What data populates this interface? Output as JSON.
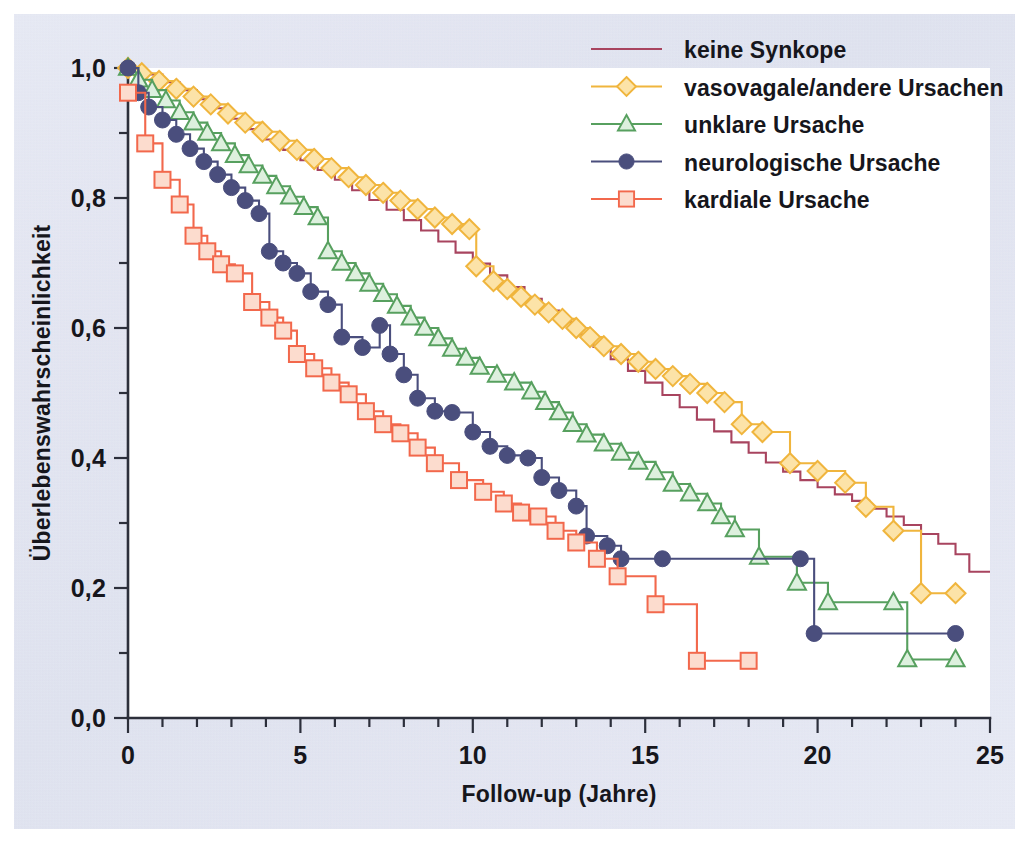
{
  "figure": {
    "background_color": "#d9dcec",
    "plot_background_color": "#ffffff",
    "border_color": "#ffffff"
  },
  "chart_data": {
    "type": "line",
    "subtype": "kaplan-meier-step",
    "title": "",
    "xlabel": "Follow-up (Jahre)",
    "ylabel": "Überlebenswahrscheinlichkeit",
    "xlim": [
      0,
      25
    ],
    "ylim": [
      0,
      1.0
    ],
    "xticks": [
      0,
      5,
      10,
      15,
      20,
      25
    ],
    "xtick_labels": [
      "0",
      "5",
      "10",
      "15",
      "20",
      "25"
    ],
    "xminor_tick_interval": 1,
    "yticks": [
      0.0,
      0.2,
      0.4,
      0.6,
      0.8,
      1.0
    ],
    "ytick_labels": [
      "0,0",
      "0,2",
      "0,4",
      "0,6",
      "0,8",
      "1,0"
    ],
    "yminor_tick_interval": 0.1,
    "grid": false,
    "legend_position": "top-right-inside",
    "decimal_separator": ",",
    "series": [
      {
        "name": "keine Synkope",
        "color": "#a8445f",
        "marker": "none",
        "points": [
          [
            0.0,
            1.0
          ],
          [
            0.5,
            0.99
          ],
          [
            1.0,
            0.978
          ],
          [
            1.5,
            0.966
          ],
          [
            2.0,
            0.952
          ],
          [
            2.5,
            0.938
          ],
          [
            3.0,
            0.922
          ],
          [
            3.5,
            0.906
          ],
          [
            4.0,
            0.89
          ],
          [
            4.5,
            0.874
          ],
          [
            5.0,
            0.858
          ],
          [
            5.5,
            0.843
          ],
          [
            6.0,
            0.828
          ],
          [
            6.5,
            0.812
          ],
          [
            7.0,
            0.797
          ],
          [
            7.5,
            0.782
          ],
          [
            8.0,
            0.766
          ],
          [
            8.5,
            0.75
          ],
          [
            9.0,
            0.733
          ],
          [
            9.5,
            0.716
          ],
          [
            10.0,
            0.699
          ],
          [
            10.5,
            0.681
          ],
          [
            11.0,
            0.663
          ],
          [
            11.5,
            0.645
          ],
          [
            12.0,
            0.627
          ],
          [
            12.5,
            0.609
          ],
          [
            13.0,
            0.59
          ],
          [
            13.5,
            0.571
          ],
          [
            14.0,
            0.552
          ],
          [
            14.5,
            0.534
          ],
          [
            15.0,
            0.516
          ],
          [
            15.5,
            0.497
          ],
          [
            16.0,
            0.478
          ],
          [
            16.5,
            0.459
          ],
          [
            17.0,
            0.441
          ],
          [
            17.5,
            0.424
          ],
          [
            18.0,
            0.408
          ],
          [
            18.5,
            0.393
          ],
          [
            19.0,
            0.379
          ],
          [
            19.5,
            0.366
          ],
          [
            20.0,
            0.355
          ],
          [
            20.5,
            0.344
          ],
          [
            21.0,
            0.334
          ],
          [
            21.5,
            0.322
          ],
          [
            22.0,
            0.31
          ],
          [
            22.5,
            0.297
          ],
          [
            23.0,
            0.283
          ],
          [
            23.5,
            0.268
          ],
          [
            24.0,
            0.252
          ],
          [
            24.4,
            0.225
          ],
          [
            25.0,
            0.225
          ]
        ]
      },
      {
        "name": "vasovagale/andere Ursachen",
        "color": "#f0b53d",
        "marker": "diamond",
        "points": [
          [
            0.0,
            1.0
          ],
          [
            0.4,
            0.992
          ],
          [
            0.9,
            0.98
          ],
          [
            1.4,
            0.968
          ],
          [
            1.9,
            0.956
          ],
          [
            2.4,
            0.944
          ],
          [
            2.9,
            0.93
          ],
          [
            3.4,
            0.916
          ],
          [
            3.9,
            0.902
          ],
          [
            4.4,
            0.888
          ],
          [
            4.9,
            0.874
          ],
          [
            5.4,
            0.86
          ],
          [
            5.9,
            0.846
          ],
          [
            6.4,
            0.832
          ],
          [
            6.9,
            0.82
          ],
          [
            7.4,
            0.808
          ],
          [
            7.9,
            0.796
          ],
          [
            8.4,
            0.783
          ],
          [
            8.9,
            0.77
          ],
          [
            9.4,
            0.76
          ],
          [
            9.9,
            0.752
          ],
          [
            10.1,
            0.695
          ],
          [
            10.6,
            0.672
          ],
          [
            11.0,
            0.66
          ],
          [
            11.4,
            0.648
          ],
          [
            11.8,
            0.636
          ],
          [
            12.2,
            0.624
          ],
          [
            12.6,
            0.614
          ],
          [
            13.0,
            0.6
          ],
          [
            13.4,
            0.586
          ],
          [
            13.8,
            0.572
          ],
          [
            14.3,
            0.56
          ],
          [
            14.8,
            0.548
          ],
          [
            15.3,
            0.537
          ],
          [
            15.8,
            0.526
          ],
          [
            16.3,
            0.514
          ],
          [
            16.8,
            0.5
          ],
          [
            17.3,
            0.486
          ],
          [
            17.8,
            0.452
          ],
          [
            18.4,
            0.44
          ],
          [
            19.2,
            0.392
          ],
          [
            20.0,
            0.38
          ],
          [
            20.8,
            0.362
          ],
          [
            21.4,
            0.325
          ],
          [
            22.2,
            0.288
          ],
          [
            23.0,
            0.192
          ],
          [
            24.0,
            0.192
          ]
        ]
      },
      {
        "name": "unklare Ursache",
        "color": "#57a05f",
        "marker": "triangle",
        "points": [
          [
            0.0,
            1.0
          ],
          [
            0.3,
            0.982
          ],
          [
            0.7,
            0.966
          ],
          [
            1.1,
            0.95
          ],
          [
            1.5,
            0.932
          ],
          [
            1.9,
            0.916
          ],
          [
            2.3,
            0.9
          ],
          [
            2.7,
            0.884
          ],
          [
            3.1,
            0.866
          ],
          [
            3.5,
            0.85
          ],
          [
            3.9,
            0.834
          ],
          [
            4.3,
            0.818
          ],
          [
            4.7,
            0.802
          ],
          [
            5.1,
            0.786
          ],
          [
            5.5,
            0.77
          ],
          [
            5.8,
            0.718
          ],
          [
            6.2,
            0.7
          ],
          [
            6.6,
            0.684
          ],
          [
            7.0,
            0.668
          ],
          [
            7.4,
            0.652
          ],
          [
            7.8,
            0.634
          ],
          [
            8.2,
            0.616
          ],
          [
            8.6,
            0.6
          ],
          [
            9.0,
            0.584
          ],
          [
            9.4,
            0.568
          ],
          [
            9.8,
            0.554
          ],
          [
            10.2,
            0.54
          ],
          [
            10.7,
            0.528
          ],
          [
            11.2,
            0.516
          ],
          [
            11.7,
            0.502
          ],
          [
            12.1,
            0.486
          ],
          [
            12.5,
            0.47
          ],
          [
            12.9,
            0.452
          ],
          [
            13.3,
            0.436
          ],
          [
            13.8,
            0.422
          ],
          [
            14.3,
            0.408
          ],
          [
            14.8,
            0.394
          ],
          [
            15.3,
            0.378
          ],
          [
            15.8,
            0.36
          ],
          [
            16.3,
            0.345
          ],
          [
            16.8,
            0.33
          ],
          [
            17.2,
            0.31
          ],
          [
            17.6,
            0.29
          ],
          [
            18.3,
            0.248
          ],
          [
            19.4,
            0.208
          ],
          [
            20.3,
            0.178
          ],
          [
            22.2,
            0.178
          ],
          [
            22.6,
            0.09
          ],
          [
            24.0,
            0.09
          ]
        ]
      },
      {
        "name": "neurologische Ursache",
        "color": "#4a4e7d",
        "marker": "circle",
        "points": [
          [
            0.0,
            1.0
          ],
          [
            0.3,
            0.962
          ],
          [
            0.6,
            0.94
          ],
          [
            1.0,
            0.92
          ],
          [
            1.4,
            0.898
          ],
          [
            1.8,
            0.876
          ],
          [
            2.2,
            0.856
          ],
          [
            2.6,
            0.836
          ],
          [
            3.0,
            0.816
          ],
          [
            3.4,
            0.796
          ],
          [
            3.8,
            0.776
          ],
          [
            4.1,
            0.718
          ],
          [
            4.5,
            0.7
          ],
          [
            4.9,
            0.684
          ],
          [
            5.3,
            0.656
          ],
          [
            5.8,
            0.636
          ],
          [
            6.2,
            0.586
          ],
          [
            6.8,
            0.57
          ],
          [
            7.3,
            0.604
          ],
          [
            7.6,
            0.56
          ],
          [
            8.0,
            0.528
          ],
          [
            8.4,
            0.492
          ],
          [
            8.9,
            0.472
          ],
          [
            9.4,
            0.47
          ],
          [
            10.0,
            0.44
          ],
          [
            10.5,
            0.418
          ],
          [
            11.0,
            0.404
          ],
          [
            11.6,
            0.4
          ],
          [
            12.0,
            0.37
          ],
          [
            12.5,
            0.35
          ],
          [
            13.0,
            0.326
          ],
          [
            13.3,
            0.28
          ],
          [
            13.9,
            0.265
          ],
          [
            14.3,
            0.245
          ],
          [
            15.5,
            0.245
          ],
          [
            19.5,
            0.245
          ],
          [
            19.9,
            0.13
          ],
          [
            24.0,
            0.13
          ]
        ]
      },
      {
        "name": "kardiale Ursache",
        "color": "#f2684c",
        "marker": "square",
        "points": [
          [
            0.0,
            0.962
          ],
          [
            0.5,
            0.884
          ],
          [
            1.0,
            0.828
          ],
          [
            1.5,
            0.79
          ],
          [
            1.9,
            0.742
          ],
          [
            2.3,
            0.718
          ],
          [
            2.7,
            0.698
          ],
          [
            3.1,
            0.684
          ],
          [
            3.6,
            0.64
          ],
          [
            4.1,
            0.616
          ],
          [
            4.5,
            0.596
          ],
          [
            4.9,
            0.56
          ],
          [
            5.4,
            0.538
          ],
          [
            5.9,
            0.516
          ],
          [
            6.4,
            0.498
          ],
          [
            6.9,
            0.472
          ],
          [
            7.4,
            0.452
          ],
          [
            7.9,
            0.438
          ],
          [
            8.4,
            0.416
          ],
          [
            8.9,
            0.392
          ],
          [
            9.6,
            0.366
          ],
          [
            10.3,
            0.348
          ],
          [
            10.9,
            0.33
          ],
          [
            11.4,
            0.316
          ],
          [
            11.9,
            0.31
          ],
          [
            12.4,
            0.288
          ],
          [
            13.0,
            0.27
          ],
          [
            13.6,
            0.245
          ],
          [
            14.2,
            0.218
          ],
          [
            15.3,
            0.175
          ],
          [
            16.5,
            0.088
          ],
          [
            18.0,
            0.088
          ]
        ]
      }
    ]
  },
  "legend": {
    "items": [
      {
        "label": "keine Synkope",
        "color": "#a8445f",
        "marker": "none"
      },
      {
        "label": "vasovagale/andere Ursachen",
        "color": "#f0b53d",
        "marker": "diamond"
      },
      {
        "label": "unklare Ursache",
        "color": "#57a05f",
        "marker": "triangle"
      },
      {
        "label": "neurologische Ursache",
        "color": "#4a4e7d",
        "marker": "circle"
      },
      {
        "label": "kardiale Ursache",
        "color": "#f2684c",
        "marker": "square"
      }
    ]
  }
}
